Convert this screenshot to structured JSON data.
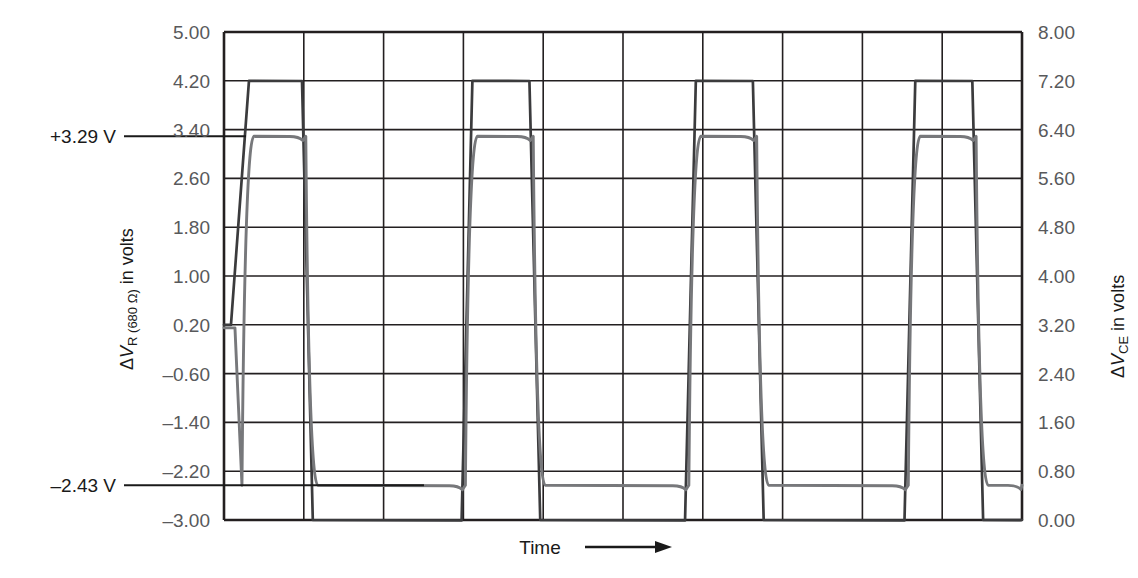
{
  "chart_data": {
    "type": "line",
    "title": "",
    "xlabel": "Time",
    "x_arrow": true,
    "grid": true,
    "legend_position": "none",
    "axes": {
      "left": {
        "label_parts": {
          "delta": "Δ",
          "v": "V",
          "sub": "R (680 Ω)",
          "tail": " in volts"
        },
        "label_text": "ΔV_R (680 Ω) in volts",
        "ylim": [
          -3.0,
          5.0
        ],
        "step": 0.8,
        "ticks": [
          "5.00",
          "4.20",
          "3.40",
          "2.60",
          "1.80",
          "1.00",
          "0.20",
          "–0.60",
          "–1.40",
          "–2.20",
          "–3.00"
        ],
        "tick_values": [
          5.0,
          4.2,
          3.4,
          2.6,
          1.8,
          1.0,
          0.2,
          -0.6,
          -1.4,
          -2.2,
          -3.0
        ]
      },
      "right": {
        "label_parts": {
          "delta": "Δ",
          "v": "V",
          "sub": "CE",
          "tail": " in volts"
        },
        "label_text": "ΔV_CE in volts",
        "ylim": [
          0.0,
          8.0
        ],
        "step": 0.8,
        "ticks": [
          "8.00",
          "7.20",
          "6.40",
          "5.60",
          "4.80",
          "4.00",
          "3.20",
          "2.40",
          "1.60",
          "0.80",
          "0.00"
        ],
        "tick_values": [
          8.0,
          7.2,
          6.4,
          5.6,
          4.8,
          4.0,
          3.2,
          2.4,
          1.6,
          0.8,
          0.0
        ]
      },
      "x": {
        "divisions": 10,
        "tick_labels": []
      }
    },
    "annotations": [
      {
        "name": "high-level-marker",
        "text": "+3.29 V",
        "value": 3.29,
        "axis": "left"
      },
      {
        "name": "low-level-marker",
        "text": "–2.43 V",
        "value": -2.43,
        "axis": "left"
      }
    ],
    "series": [
      {
        "name": "V_R(680) square wave",
        "color": "#3b3b3d",
        "style": "square-wave",
        "high": 4.2,
        "low": -3.0,
        "description": "Sharp-edged square wave swinging between +4.20 V and –3.00 V"
      },
      {
        "name": "V_CE filtered wave",
        "color": "#77787b",
        "style": "rounded-square-wave",
        "high": 3.29,
        "low": -2.43,
        "description": "Rounded (RC-filtered) square wave swinging between +3.29 V and –2.43 V"
      }
    ],
    "cycles": 4,
    "transition_fractions": [
      0.02,
      0.1,
      0.3,
      0.385,
      0.58,
      0.665,
      0.855,
      0.94
    ]
  },
  "figure": {
    "time_label": "Time",
    "arrow_icon": "right-arrow-icon"
  }
}
